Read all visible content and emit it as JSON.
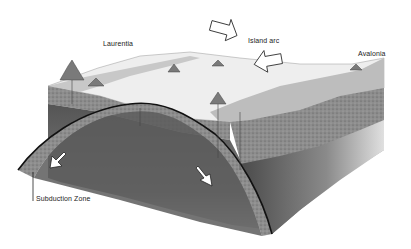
{
  "diagram": {
    "labels": {
      "laurentia": "Laurentia",
      "island_arc": "Island arc",
      "avalonia": "Avalonia",
      "subduction_zone": "Subduction Zone"
    },
    "arrows": [
      {
        "name": "convergence-arrow-top",
        "direction": "down-right"
      },
      {
        "name": "convergence-arrow-right",
        "direction": "up-left"
      },
      {
        "name": "plate-motion-arrow-left",
        "direction": "down-left"
      },
      {
        "name": "plate-motion-arrow-right",
        "direction": "down-right"
      }
    ],
    "colors": {
      "background": "#ffffff",
      "surface": "#ececec",
      "crust": "#8a8a8a",
      "mantle_dark": "#4a4a4a",
      "mantle_light": "#d8d8d8",
      "fault_line": "#111111"
    }
  }
}
